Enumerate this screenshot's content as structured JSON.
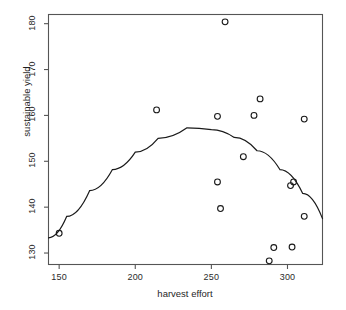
{
  "chart_data": {
    "type": "scatter",
    "title": "",
    "xlabel": "harvest effort",
    "ylabel": "sustainable yield",
    "xlim": [
      143,
      323
    ],
    "ylim": [
      127.5,
      182
    ],
    "xticks": [
      150,
      200,
      250,
      300
    ],
    "yticks": [
      130,
      140,
      150,
      160,
      170,
      180
    ],
    "grid": false,
    "legend": null,
    "marker": "open-circle",
    "points": [
      {
        "x": 150,
        "y": 134.3
      },
      {
        "x": 214,
        "y": 161.2
      },
      {
        "x": 254,
        "y": 159.8
      },
      {
        "x": 259,
        "y": 180.4
      },
      {
        "x": 278,
        "y": 160.0
      },
      {
        "x": 282,
        "y": 163.6
      },
      {
        "x": 311,
        "y": 159.2
      },
      {
        "x": 271,
        "y": 151.0
      },
      {
        "x": 254,
        "y": 145.5
      },
      {
        "x": 256,
        "y": 139.7
      },
      {
        "x": 302,
        "y": 144.7
      },
      {
        "x": 304,
        "y": 145.5
      },
      {
        "x": 311,
        "y": 138.0
      },
      {
        "x": 291,
        "y": 131.2
      },
      {
        "x": 303,
        "y": 131.3
      },
      {
        "x": 288,
        "y": 128.3
      }
    ],
    "fit_curve": {
      "kind": "quadratic",
      "description": "fitted parabola peaking near harvest effort 234",
      "vertex": {
        "x": 234,
        "y": 157.3
      },
      "samples": [
        {
          "x": 143,
          "y": 133.3
        },
        {
          "x": 155,
          "y": 138.0
        },
        {
          "x": 170,
          "y": 143.6
        },
        {
          "x": 185,
          "y": 148.2
        },
        {
          "x": 200,
          "y": 152.0
        },
        {
          "x": 215,
          "y": 155.0
        },
        {
          "x": 234,
          "y": 157.3
        },
        {
          "x": 250,
          "y": 156.9
        },
        {
          "x": 265,
          "y": 155.2
        },
        {
          "x": 280,
          "y": 152.3
        },
        {
          "x": 295,
          "y": 148.2
        },
        {
          "x": 310,
          "y": 143.0
        },
        {
          "x": 323,
          "y": 137.5
        }
      ]
    }
  },
  "axes": {
    "x_tick_labels": [
      "150",
      "200",
      "250",
      "300"
    ],
    "y_tick_labels": [
      "130",
      "140",
      "150",
      "160",
      "170",
      "180"
    ],
    "x_title": "harvest effort",
    "y_title": "sustainable yield"
  },
  "colors": {
    "frame": "#555555",
    "marker_stroke": "#1a1a1a",
    "curve": "#1a1a1a",
    "text": "#1f1f1f",
    "background": "#ffffff"
  }
}
